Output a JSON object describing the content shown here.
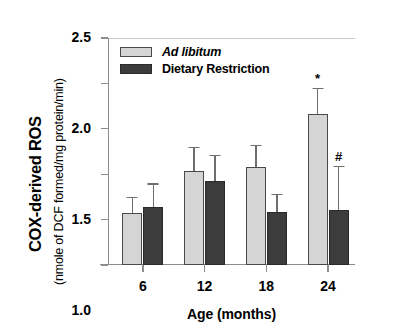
{
  "chart_data": {
    "type": "bar",
    "title": "",
    "subtitle": "",
    "xlabel": "Age (months)",
    "ylabel": "COX-derived ROS",
    "ylabel_line2": "(nmole of DCF formed/mg protein/min)",
    "categories": [
      "6",
      "12",
      "18",
      "24"
    ],
    "ylim": [
      0.0,
      2.5
    ],
    "yticks": [
      "0.0",
      ".5",
      "1.0",
      "1.5",
      "2.0",
      "2.5"
    ],
    "ytick_values": [
      0.0,
      0.5,
      1.0,
      1.5,
      2.0,
      2.5
    ],
    "grid": false,
    "legend_position": "top-left",
    "series": [
      {
        "name": "Ad libitum",
        "italic": true,
        "color": "#d5d5d5",
        "values": [
          0.57,
          1.03,
          1.08,
          1.66
        ],
        "errors_upper": [
          0.75,
          1.3,
          1.32,
          1.95
        ],
        "annotations": [
          "",
          "",
          "",
          "*"
        ]
      },
      {
        "name": "Dietary Restriction",
        "italic": false,
        "color": "#3c3c3c",
        "values": [
          0.64,
          0.92,
          0.58,
          0.61
        ],
        "errors_upper": [
          0.9,
          1.21,
          0.78,
          1.09
        ],
        "annotations": [
          "",
          "",
          "",
          "#"
        ]
      }
    ]
  },
  "axes": {
    "line_color": "#8d8d8d"
  }
}
